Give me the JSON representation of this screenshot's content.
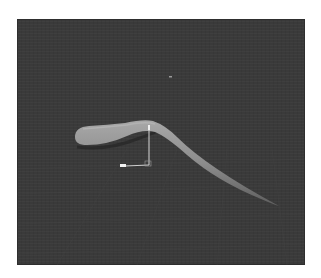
{
  "scene": {
    "description": "3D viewport render of a curved tapering tube shape with a transform gizmo over a dark gray grid floor",
    "background_color": "#3a3a3a",
    "object_color": "#8a8a8a",
    "gizmo": {
      "vertical_axis_color": "#d8d8d8",
      "horizontal_axis_color": "#e8e8e8"
    }
  }
}
